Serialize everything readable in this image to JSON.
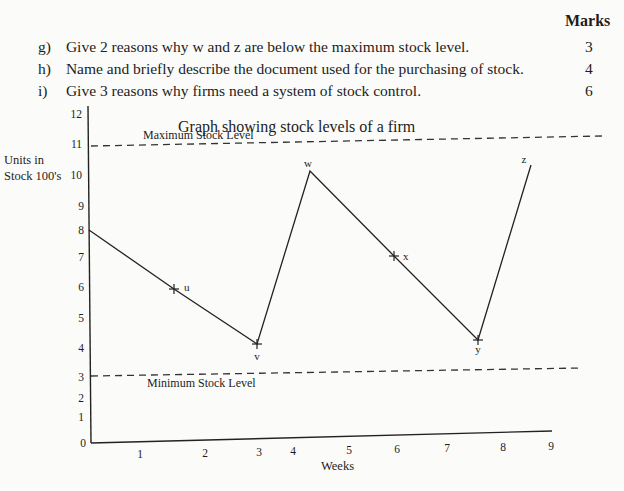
{
  "header": {
    "marks_label": "Marks"
  },
  "questions": [
    {
      "letter": "g)",
      "text": "Give 2 reasons why w and z are below the maximum stock level.",
      "marks": "3"
    },
    {
      "letter": "h)",
      "text": "Name and briefly describe the document used for the purchasing of stock.",
      "marks": "4"
    },
    {
      "letter": "i)",
      "text": "Give 3 reasons why firms need a system of stock control.",
      "marks": "6"
    }
  ],
  "chart_data": {
    "type": "line",
    "title": "Graph showing stock levels of a firm",
    "xlabel": "Weeks",
    "ylabel": "Units in Stock 100's",
    "ylabel_lines": [
      "Units in",
      "Stock 100's"
    ],
    "x_ticks": [
      "1",
      "2",
      "3",
      "4",
      "5",
      "6",
      "7",
      "8",
      "9"
    ],
    "y_ticks": [
      "0",
      "1",
      "2",
      "3",
      "4",
      "5",
      "6",
      "7",
      "8",
      "9",
      "10",
      "11",
      "12"
    ],
    "xlim": [
      0,
      9
    ],
    "ylim": [
      0,
      12
    ],
    "grid": false,
    "reference_lines": [
      {
        "name": "Maximum Stock Level",
        "y": 11,
        "style": "dashed"
      },
      {
        "name": "Minimum Stock Level",
        "y": 3,
        "style": "dashed"
      }
    ],
    "series": [
      {
        "name": "Stock level",
        "points": [
          {
            "label": "",
            "x": 0,
            "y": 8
          },
          {
            "label": "u",
            "x": 1.5,
            "y": 6
          },
          {
            "label": "v",
            "x": 3,
            "y": 4
          },
          {
            "label": "w",
            "x": 4,
            "y": 10
          },
          {
            "label": "x",
            "x": 5.5,
            "y": 7
          },
          {
            "label": "y",
            "x": 7,
            "y": 4.2
          },
          {
            "label": "z",
            "x": 8,
            "y": 10.2
          }
        ]
      }
    ]
  }
}
